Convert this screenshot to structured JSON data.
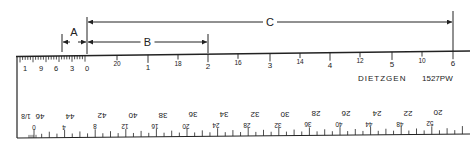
{
  "dimensions": {
    "A": {
      "label": "A",
      "from_x": 62,
      "to_x": 87,
      "y": 42
    },
    "B": {
      "label": "B",
      "from_x": 87,
      "to_x": 208,
      "y": 42
    },
    "C": {
      "label": "C",
      "from_x": 87,
      "to_x": 453,
      "y": 22
    }
  },
  "ruler": {
    "brand": "DIETZGEN",
    "model": "1527PW",
    "top_scale": {
      "fine_labels": [
        {
          "text": "1",
          "x": 25
        },
        {
          "text": "9",
          "x": 41
        },
        {
          "text": "6",
          "x": 56
        },
        {
          "text": "3",
          "x": 72
        },
        {
          "text": "0",
          "x": 87
        }
      ],
      "main_labels": [
        {
          "text": "20",
          "x": 117,
          "minor": true
        },
        {
          "text": "1",
          "x": 148,
          "minor": false
        },
        {
          "text": "18",
          "x": 178,
          "minor": true
        },
        {
          "text": "2",
          "x": 208,
          "minor": false
        },
        {
          "text": "16",
          "x": 238,
          "minor": true
        },
        {
          "text": "3",
          "x": 270,
          "minor": false
        },
        {
          "text": "14",
          "x": 300,
          "minor": true
        },
        {
          "text": "4",
          "x": 330,
          "minor": false
        },
        {
          "text": "12",
          "x": 360,
          "minor": true
        },
        {
          "text": "5",
          "x": 392,
          "minor": false
        },
        {
          "text": "10",
          "x": 422,
          "minor": true
        },
        {
          "text": "6",
          "x": 453,
          "minor": false
        }
      ]
    },
    "bottom_scale": {
      "scale_label": "1/8",
      "upper_labels": [
        {
          "text": "46",
          "x": 40
        },
        {
          "text": "44",
          "x": 70
        },
        {
          "text": "42",
          "x": 102
        },
        {
          "text": "40",
          "x": 133
        },
        {
          "text": "38",
          "x": 163
        },
        {
          "text": "36",
          "x": 193
        },
        {
          "text": "34",
          "x": 224
        },
        {
          "text": "32",
          "x": 255
        },
        {
          "text": "30",
          "x": 285
        },
        {
          "text": "28",
          "x": 316
        },
        {
          "text": "26",
          "x": 346
        },
        {
          "text": "24",
          "x": 377
        },
        {
          "text": "22",
          "x": 408
        },
        {
          "text": "20",
          "x": 438
        }
      ],
      "lower_labels": [
        {
          "text": "0",
          "x": 34
        },
        {
          "text": "4",
          "x": 64
        },
        {
          "text": "8",
          "x": 95
        },
        {
          "text": "12",
          "x": 125
        },
        {
          "text": "16",
          "x": 155
        },
        {
          "text": "20",
          "x": 186
        },
        {
          "text": "24",
          "x": 216
        },
        {
          "text": "28",
          "x": 247
        },
        {
          "text": "32",
          "x": 278
        },
        {
          "text": "36",
          "x": 308
        },
        {
          "text": "40",
          "x": 339
        },
        {
          "text": "44",
          "x": 369
        },
        {
          "text": "48",
          "x": 400
        },
        {
          "text": "52",
          "x": 430
        }
      ]
    }
  }
}
